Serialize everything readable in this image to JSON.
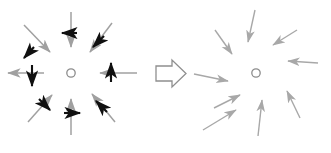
{
  "figure": {
    "title": "",
    "caption": "",
    "background_color": "#ffffff",
    "width": 331,
    "height": 153,
    "gray_color": "#a0a0a0",
    "gray_color_light": "#b4b4b4",
    "black_color": "#101010",
    "circle_color": "#8c8c8c",
    "transition_symbol_color": "#8f8f8f"
  },
  "left_panel": {
    "label": "before",
    "center": {
      "x": 71,
      "y": 73,
      "radius": 4.2
    },
    "vector_field_name": "radial-field-with-perturbations",
    "arrow_count": 8,
    "perturbation_count": 8,
    "arrows": [
      {
        "name": "arrow-n",
        "angle_deg": 270,
        "x1": 71,
        "y1": 12,
        "x2": 71,
        "y2": 47,
        "head": "end",
        "note": "points down toward center"
      },
      {
        "name": "arrow-ne",
        "angle_deg": 315,
        "x1": 112,
        "y1": 23,
        "x2": 90,
        "y2": 52,
        "head": "end",
        "note": "points down-left toward center"
      },
      {
        "name": "arrow-e",
        "angle_deg": 0,
        "x1": 137,
        "y1": 73,
        "x2": 100,
        "y2": 73,
        "head": "end",
        "note": "points left toward center"
      },
      {
        "name": "arrow-se",
        "angle_deg": 45,
        "x1": 115,
        "y1": 122,
        "x2": 92,
        "y2": 94,
        "head": "end",
        "note": "points up-left toward center"
      },
      {
        "name": "arrow-s",
        "angle_deg": 90,
        "x1": 71,
        "y1": 135,
        "x2": 71,
        "y2": 99,
        "head": "end",
        "note": "points up toward center"
      },
      {
        "name": "arrow-sw",
        "angle_deg": 135,
        "x1": 28,
        "y1": 122,
        "x2": 52,
        "y2": 95,
        "head": "end",
        "note": "points up-right toward center"
      },
      {
        "name": "arrow-w",
        "angle_deg": 180,
        "x1": 8,
        "y1": 73,
        "x2": 44,
        "y2": 73,
        "head": "start",
        "note": "points left away from center"
      },
      {
        "name": "arrow-nw",
        "angle_deg": 225,
        "x1": 24,
        "y1": 25,
        "x2": 50,
        "y2": 52,
        "head": "end",
        "note": "points down-right toward center"
      }
    ],
    "perturbations": [
      {
        "name": "perturbation-n",
        "x1": 77,
        "y1": 33,
        "x2": 62,
        "y2": 33,
        "direction": "left"
      },
      {
        "name": "perturbation-ne",
        "x1": 104,
        "y1": 36,
        "x2": 93,
        "y2": 47,
        "direction": "down-left"
      },
      {
        "name": "perturbation-e",
        "x1": 111,
        "y1": 82,
        "x2": 111,
        "y2": 63,
        "direction": "up"
      },
      {
        "name": "perturbation-se",
        "x1": 107,
        "y1": 112,
        "x2": 96,
        "y2": 101,
        "direction": "up-left"
      },
      {
        "name": "perturbation-s",
        "x1": 64,
        "y1": 113,
        "x2": 80,
        "y2": 113,
        "direction": "right"
      },
      {
        "name": "perturbation-sw",
        "x1": 39,
        "y1": 99,
        "x2": 50,
        "y2": 110,
        "direction": "down-right"
      },
      {
        "name": "perturbation-w",
        "x1": 32,
        "y1": 65,
        "x2": 32,
        "y2": 86,
        "direction": "down"
      },
      {
        "name": "perturbation-nw",
        "x1": 34,
        "y1": 47,
        "x2": 24,
        "y2": 58,
        "direction": "down-left"
      }
    ]
  },
  "transition": {
    "name": "transition-arrow",
    "symbol": "hollow-right-arrow",
    "direction": "right",
    "x": 156,
    "y": 61,
    "width": 30,
    "height": 25
  },
  "right_panel": {
    "label": "after",
    "center": {
      "x": 256,
      "y": 73,
      "radius": 4.2
    },
    "vector_field_name": "converged-radial-inward-field",
    "arrow_count": 9,
    "arrows": [
      {
        "name": "arrow-r1",
        "x1": 255,
        "y1": 10,
        "x2": 248,
        "y2": 42,
        "note": "upper, points down-left inward"
      },
      {
        "name": "arrow-r2",
        "x1": 297,
        "y1": 30,
        "x2": 273,
        "y2": 45,
        "note": "upper-right, points down-left inward"
      },
      {
        "name": "arrow-r3",
        "x1": 318,
        "y1": 63,
        "x2": 288,
        "y2": 61,
        "note": "right, points left inward"
      },
      {
        "name": "arrow-r4",
        "x1": 300,
        "y1": 118,
        "x2": 287,
        "y2": 91,
        "note": "lower-right, points up-left inward"
      },
      {
        "name": "arrow-r5",
        "x1": 258,
        "y1": 136,
        "x2": 262,
        "y2": 100,
        "note": "lower, points up inward"
      },
      {
        "name": "arrow-r6",
        "x1": 203,
        "y1": 130,
        "x2": 236,
        "y2": 110,
        "note": "lower-left, points up-right inward"
      },
      {
        "name": "arrow-r7",
        "x1": 214,
        "y1": 108,
        "x2": 240,
        "y2": 95,
        "note": "left-lower, points up-right inward"
      },
      {
        "name": "arrow-r8",
        "x1": 194,
        "y1": 74,
        "x2": 228,
        "y2": 81,
        "note": "left, points right inward"
      },
      {
        "name": "arrow-r9",
        "x1": 215,
        "y1": 30,
        "x2": 232,
        "y2": 54,
        "note": "upper-left, points down-right inward"
      }
    ]
  }
}
